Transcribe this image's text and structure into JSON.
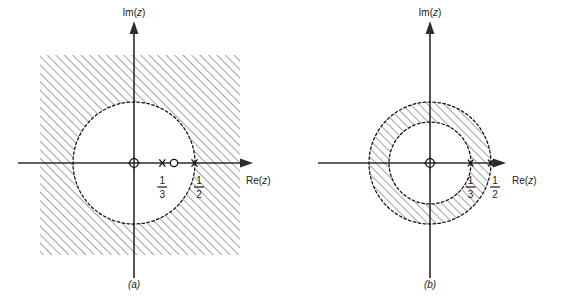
{
  "figure": {
    "background_color": "#ffffff",
    "ink_color": "#1a1a1a",
    "hatch_color": "#4a4a4a",
    "axis_labels": {
      "real": "Re(z)",
      "real_prefix": "Re(",
      "real_var": "z",
      "real_suffix": ")",
      "imag": "Im(z)",
      "imag_prefix": "Im(",
      "imag_var": "z",
      "imag_suffix": ")"
    },
    "panels": [
      {
        "id": "a",
        "label": "(a)",
        "roc_description": "exterior of circle of radius 1/2",
        "shading": "hatched region outside dashed circle of radius 1/2",
        "circles": [
          {
            "name": "roc-boundary",
            "radius_label": "1/2",
            "radius_value": 0.5,
            "style": "dashed"
          }
        ],
        "axis_annotations": [
          {
            "value_label": "1/3",
            "numerator": "1",
            "denominator": "3",
            "position": 0.3333
          },
          {
            "value_label": "1/2",
            "numerator": "1",
            "denominator": "2",
            "position": 0.5
          }
        ],
        "markers": [
          {
            "type": "pole",
            "glyph": "x",
            "position": 0.3333
          },
          {
            "type": "zero",
            "glyph": "o",
            "position": 0.4167
          },
          {
            "type": "pole",
            "glyph": "x",
            "position": 0.5
          }
        ],
        "origin_marker": {
          "type": "origin",
          "glyph": "circle-with-cross",
          "position": 0
        }
      },
      {
        "id": "b",
        "label": "(b)",
        "roc_description": "annulus between radius 1/3 and radius 1/2",
        "shading": "hatched annulus between dashed circles of radius 1/3 and 1/2",
        "circles": [
          {
            "name": "roc-inner-boundary",
            "radius_label": "1/3",
            "radius_value": 0.3333,
            "style": "dashed"
          },
          {
            "name": "roc-outer-boundary",
            "radius_label": "1/2",
            "radius_value": 0.5,
            "style": "dashed"
          }
        ],
        "axis_annotations": [
          {
            "value_label": "1/3",
            "numerator": "1",
            "denominator": "3",
            "position": 0.3333
          },
          {
            "value_label": "1/2",
            "numerator": "1",
            "denominator": "2",
            "position": 0.5
          }
        ],
        "markers": [
          {
            "type": "pole",
            "glyph": "x",
            "position": 0.3333
          },
          {
            "type": "pole",
            "glyph": "x",
            "position": 0.5
          }
        ],
        "origin_marker": {
          "type": "origin",
          "glyph": "circle-with-cross",
          "position": 0
        }
      }
    ]
  }
}
